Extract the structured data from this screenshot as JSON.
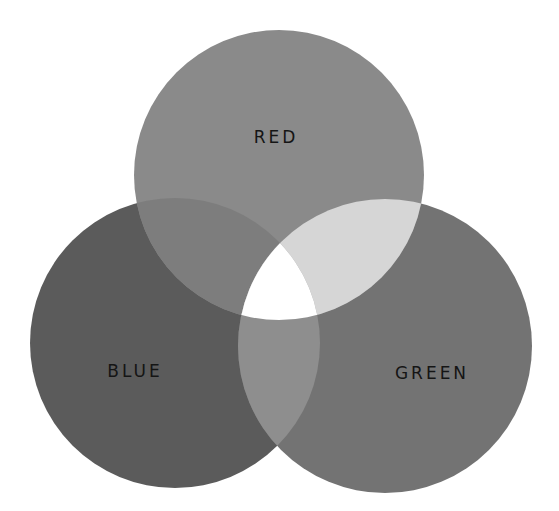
{
  "diagram": {
    "type": "venn",
    "colors": {
      "background": "#ffffff",
      "red": "#8a8a8a",
      "blue": "#5b5b5b",
      "green": "#737373",
      "red_blue": "#7d7d7d",
      "red_green": "#d6d6d6",
      "blue_green": "#8e8e8e",
      "all": "#ffffff",
      "label": "#151515"
    },
    "circles": [
      {
        "id": "red",
        "label": "RED",
        "cx": 279,
        "cy": 175,
        "r": 145
      },
      {
        "id": "blue",
        "label": "BLUE",
        "cx": 175,
        "cy": 343,
        "r": 145
      },
      {
        "id": "green",
        "label": "GREEN",
        "cx": 385,
        "cy": 346,
        "r": 147
      }
    ]
  }
}
